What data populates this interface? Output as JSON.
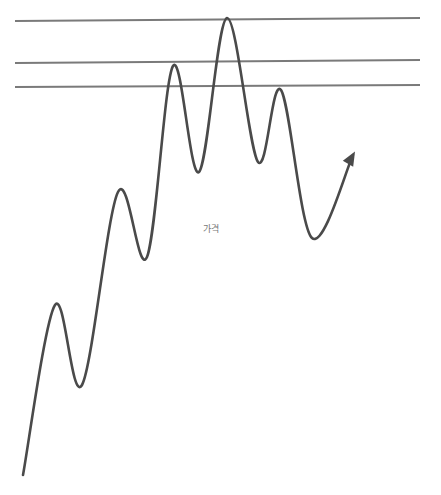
{
  "chart_data": {
    "type": "line",
    "title": "",
    "xlabel": "",
    "ylabel": "",
    "annotation": "가격",
    "grid": false,
    "legend": null,
    "line_color": "#4a4a4a",
    "hline_color": "#7a7a7a",
    "horizontal_lines": [
      {
        "x1": 15,
        "y1": 21,
        "x2": 420,
        "y2": 18
      },
      {
        "x1": 15,
        "y1": 63,
        "x2": 420,
        "y2": 60
      },
      {
        "x1": 15,
        "y1": 87,
        "x2": 420,
        "y2": 85
      }
    ],
    "curve_points": [
      [
        23,
        475
      ],
      [
        55,
        305
      ],
      [
        82,
        385
      ],
      [
        118,
        192
      ],
      [
        147,
        257
      ],
      [
        173,
        66
      ],
      [
        199,
        172
      ],
      [
        227,
        18
      ],
      [
        258,
        162
      ],
      [
        281,
        90
      ],
      [
        312,
        238
      ],
      [
        353,
        155
      ]
    ],
    "arrow_end": true
  },
  "labels": {
    "price": "가격"
  }
}
